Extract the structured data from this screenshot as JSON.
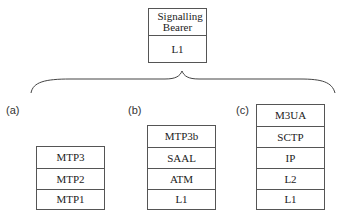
{
  "top_stack": {
    "rows": [
      "Signalling Bearer",
      "L1"
    ]
  },
  "stacks": [
    {
      "label": "(a)",
      "rows": [
        "MTP3",
        "MTP2",
        "MTP1"
      ]
    },
    {
      "label": "(b)",
      "rows": [
        "MTP3b",
        "SAAL",
        "ATM",
        "L1"
      ]
    },
    {
      "label": "(c)",
      "rows": [
        "M3UA",
        "SCTP",
        "IP",
        "L2",
        "L1"
      ]
    }
  ]
}
